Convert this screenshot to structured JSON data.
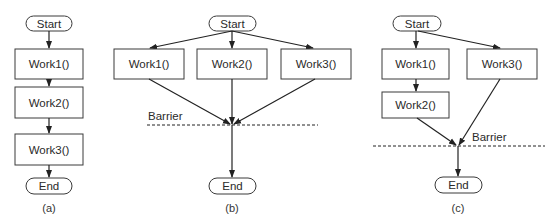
{
  "diagrams": {
    "a": {
      "caption": "(a)",
      "start": "Start",
      "end": "End",
      "tasks": [
        "Work1()",
        "Work2()",
        "Work3()"
      ]
    },
    "b": {
      "caption": "(b)",
      "start": "Start",
      "end": "End",
      "tasks": [
        "Work1()",
        "Work2()",
        "Work3()"
      ],
      "barrier_label": "Barrier"
    },
    "c": {
      "caption": "(c)",
      "start": "Start",
      "end": "End",
      "tasks": [
        "Work1()",
        "Work2()",
        "Work3()"
      ],
      "barrier_label": "Barrier"
    }
  },
  "colors": {
    "stroke": "#222222",
    "text": "#2a2a2a",
    "background": "#ffffff"
  }
}
